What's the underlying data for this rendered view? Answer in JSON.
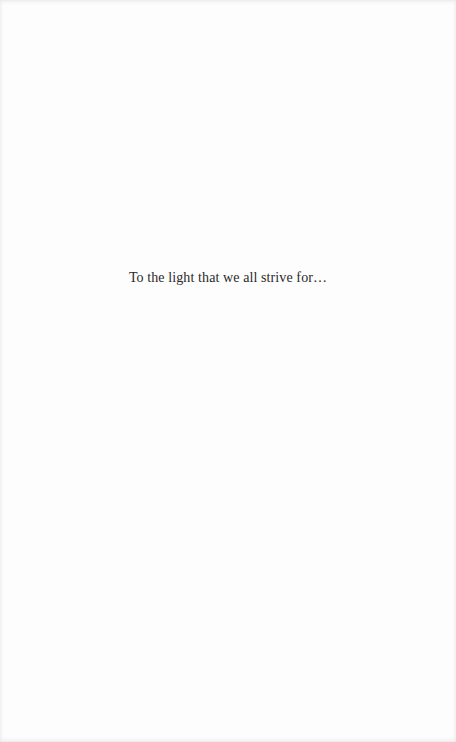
{
  "page": {
    "dedication": "To the light that we all strive for…"
  }
}
